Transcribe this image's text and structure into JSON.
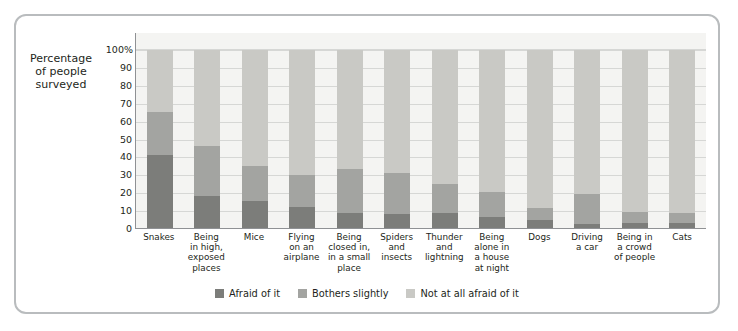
{
  "figure": {
    "axis_title_lines": [
      "Percentage",
      "of people",
      "surveyed"
    ],
    "y_axis_ticks": [
      "100%",
      "90",
      "80",
      "70",
      "60",
      "50",
      "40",
      "30",
      "20",
      "10",
      "0"
    ]
  },
  "legend": {
    "items": [
      {
        "label": "Afraid of it",
        "color": "#7c7d7a",
        "swatch_name": "legend-swatch-afraid"
      },
      {
        "label": "Bothers slightly",
        "color": "#a3a4a1",
        "swatch_name": "legend-swatch-bothers"
      },
      {
        "label": "Not at all afraid of it",
        "color": "#c9c9c5",
        "swatch_name": "legend-swatch-not-afraid"
      }
    ]
  },
  "chart_data": {
    "type": "bar",
    "subtype": "stacked-percentage",
    "title": "",
    "xlabel": "",
    "ylabel": "Percentage of people surveyed",
    "ylim": [
      0,
      100
    ],
    "yticks": [
      0,
      10,
      20,
      30,
      40,
      50,
      60,
      70,
      80,
      90,
      100
    ],
    "grid": true,
    "legend_position": "bottom-center",
    "categories": [
      "Snakes",
      "Being in high, exposed places",
      "Mice",
      "Flying on an airplane",
      "Being closed in, in a small place",
      "Spiders and insects",
      "Thunder and lightning",
      "Being alone in a house at night",
      "Dogs",
      "Driving a car",
      "Being in a crowd of people",
      "Cats"
    ],
    "category_label_lines": [
      [
        "Snakes"
      ],
      [
        "Being",
        "in high,",
        "exposed",
        "places"
      ],
      [
        "Mice"
      ],
      [
        "Flying",
        "on an",
        "airplane"
      ],
      [
        "Being",
        "closed in,",
        "in a small",
        "place"
      ],
      [
        "Spiders",
        "and",
        "insects"
      ],
      [
        "Thunder",
        "and",
        "lightning"
      ],
      [
        "Being",
        "alone in",
        "a house",
        "at night"
      ],
      [
        "Dogs"
      ],
      [
        "Driving",
        "a car"
      ],
      [
        "Being in",
        "a crowd",
        "of people"
      ],
      [
        "Cats"
      ]
    ],
    "series": [
      {
        "name": "Afraid of it",
        "color": "#7c7d7a",
        "values": [
          41,
          18,
          15,
          12,
          8.5,
          8,
          8.5,
          6,
          4.5,
          2,
          3,
          3
        ]
      },
      {
        "name": "Bothers slightly",
        "color": "#a3a4a1",
        "values": [
          24,
          28,
          20,
          18,
          24.5,
          23,
          16,
          14,
          6.5,
          17,
          6,
          5.5
        ]
      },
      {
        "name": "Not at all afraid of it",
        "color": "#c9c9c5",
        "values": [
          35,
          54,
          65,
          70,
          67,
          69,
          75.5,
          80,
          89,
          81,
          91,
          91.5
        ]
      }
    ],
    "cumulative_tops": {
      "afraid_of_it": [
        41,
        18,
        15,
        12,
        8.5,
        8,
        8.5,
        6,
        4.5,
        2,
        3,
        3
      ],
      "through_bothers_slightly": [
        65,
        46,
        35,
        30,
        33,
        31,
        24.5,
        20,
        11,
        19,
        9,
        8.5
      ]
    }
  }
}
